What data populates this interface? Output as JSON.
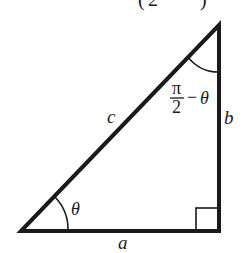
{
  "diagram": {
    "type": "right-triangle",
    "colors": {
      "stroke": "#1a1a1a",
      "background": "#ffffff",
      "top_fragment": "#555555"
    },
    "top_fragment": {
      "left_paren": "(",
      "digit": "2",
      "right_paren": ")"
    },
    "vertices": {
      "bottom_left": [
        21,
        231
      ],
      "bottom_right": [
        219,
        231
      ],
      "top": [
        219,
        25
      ]
    },
    "labels": {
      "hypotenuse": "c",
      "vertical_side": "b",
      "base": "a",
      "angle_bottom_left": "θ",
      "angle_top": {
        "numerator": "π",
        "denominator": "2",
        "minus": "−",
        "theta": "θ"
      }
    },
    "right_angle_marker": {
      "corner": "bottom_right",
      "size": 22
    }
  }
}
